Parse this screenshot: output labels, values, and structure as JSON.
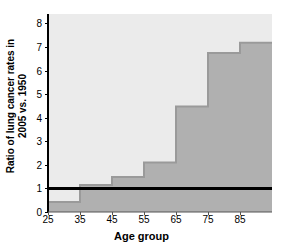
{
  "chart_data": {
    "type": "area",
    "title": "",
    "xlabel": "Age group",
    "ylabel_line1": "Ratio of lung cancer rates in",
    "ylabel_line2": "2005 vs. 1950",
    "ylabel": "Ratio of lung cancer rates in 2005 vs. 1950",
    "categories": [
      "25",
      "35",
      "45",
      "55",
      "65",
      "75",
      "85"
    ],
    "x_bin_edges": [
      25,
      35,
      45,
      55,
      65,
      75,
      85,
      95
    ],
    "values": [
      0.42,
      1.15,
      1.48,
      2.1,
      4.47,
      6.75,
      7.18
    ],
    "series": [
      {
        "name": "Ratio of lung cancer rates 2005 vs. 1950",
        "values": [
          0.42,
          1.15,
          1.48,
          2.1,
          4.47,
          6.75,
          7.18
        ]
      }
    ],
    "xticks": [
      "25",
      "35",
      "45",
      "55",
      "65",
      "75",
      "85"
    ],
    "xtick_values": [
      25,
      35,
      45,
      55,
      65,
      75,
      85
    ],
    "yticks": [
      "0",
      "1",
      "2",
      "3",
      "4",
      "5",
      "6",
      "7",
      "8"
    ],
    "ytick_values": [
      0,
      1,
      2,
      3,
      4,
      5,
      6,
      7,
      8
    ],
    "xlim": [
      25,
      95
    ],
    "ylim": [
      0,
      8.4
    ],
    "grid": false,
    "legend": "none",
    "reference_line": {
      "label": "",
      "value": 1,
      "color": "#000000",
      "orientation": "horizontal"
    },
    "colors": {
      "plot_background": "#ebebeb",
      "area_fill": "#b0b0b0",
      "step_outline": "#9a9a9a",
      "axis": "#000000",
      "text": "#000000",
      "page_background": "#ffffff"
    }
  }
}
